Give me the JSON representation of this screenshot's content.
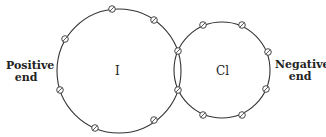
{
  "labels": {
    "positive": [
      "Positive",
      "end"
    ],
    "negative": [
      "Negative",
      "end"
    ],
    "atom_left": "I",
    "atom_right": "Cl"
  },
  "circles": {
    "iodine": {
      "cx": 119,
      "cy": 71,
      "r": 62
    },
    "chlorine": {
      "cx": 222,
      "cy": 70,
      "r": 48
    }
  },
  "electrons": [
    [
      112,
      9
    ],
    [
      154,
      20
    ],
    [
      65,
      39
    ],
    [
      60,
      90
    ],
    [
      95,
      128
    ],
    [
      154,
      120
    ],
    [
      178,
      51
    ],
    [
      178,
      90
    ],
    [
      203,
      25
    ],
    [
      242,
      25
    ],
    [
      268,
      52
    ],
    [
      266,
      89
    ],
    [
      203,
      115
    ],
    [
      242,
      115
    ]
  ],
  "colors": {
    "stroke": "#333333"
  }
}
